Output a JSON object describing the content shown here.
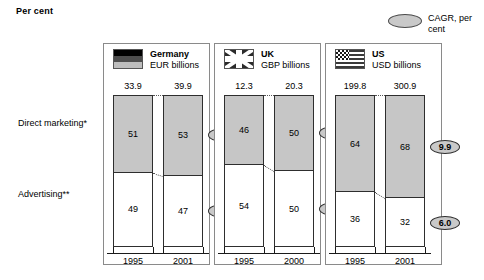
{
  "chart_unit_title": "Per cent",
  "legend": {
    "cagr_label_line1": "CAGR, per",
    "cagr_label_line2": "cent",
    "swatch_name": "cagr-ellipse-swatch",
    "swatch_color": "#c9c9c9"
  },
  "row_labels": {
    "direct": "Direct marketing*",
    "advertising": "Advertising**"
  },
  "colors": {
    "direct_marketing_fill": "#c6c6c6",
    "advertising_fill": "#ffffff",
    "bar_outline": "#2e2e2e",
    "panel_border": "#8a8a8a"
  },
  "chart_data": {
    "type": "bar",
    "title": "Per cent",
    "subtitle": "",
    "xlabel": "",
    "ylabel": "Per cent",
    "ylim": [
      0,
      100
    ],
    "grid": false,
    "legend_position": "top-right",
    "stacked": true,
    "stack_percent": true,
    "annotations": [
      "CAGR, per cent",
      "Direct marketing*",
      "Advertising**"
    ],
    "series": [
      {
        "name": "Direct marketing*",
        "fill": "#c6c6c6"
      },
      {
        "name": "Advertising**",
        "fill": "#ffffff"
      }
    ],
    "panels": [
      {
        "country": "Germany",
        "flag": "germany-flag-icon",
        "currency_unit": "EUR billions",
        "categories": [
          "1995",
          "2001"
        ],
        "totals": [
          "33.9",
          "39.9"
        ],
        "direct_marketing": [
          51,
          53
        ],
        "advertising": [
          49,
          47
        ],
        "cagr_direct": "5.5",
        "cagr_advertising": "2.8"
      },
      {
        "country": "UK",
        "flag": "uk-flag-icon",
        "currency_unit": "GBP billions",
        "categories": [
          "1995",
          "2000"
        ],
        "totals": [
          "12.3",
          "20.3"
        ],
        "direct_marketing": [
          46,
          50
        ],
        "advertising": [
          54,
          50
        ],
        "cagr_direct": "12.4",
        "cagr_advertising": "8.9"
      },
      {
        "country": "US",
        "flag": "us-flag-icon",
        "currency_unit": "USD billions",
        "categories": [
          "1995",
          "2001"
        ],
        "totals": [
          "199.8",
          "300.9"
        ],
        "direct_marketing": [
          64,
          68
        ],
        "advertising": [
          36,
          32
        ],
        "cagr_direct": "9.9",
        "cagr_advertising": "6.0"
      }
    ]
  }
}
